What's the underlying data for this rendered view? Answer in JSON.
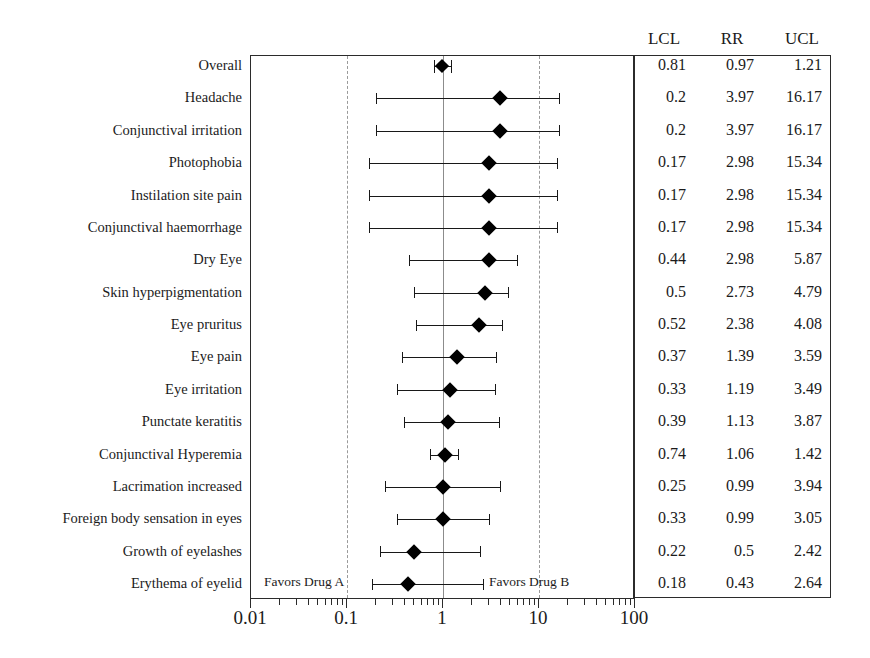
{
  "chart_data": {
    "type": "forest",
    "title": "",
    "xlabel": "",
    "ylabel": "",
    "x_scale": "log10",
    "xlim": [
      0.01,
      100
    ],
    "x_ticks": [
      0.01,
      0.1,
      1,
      10,
      100
    ],
    "x_tick_labels": [
      "0.01",
      "0.1",
      "1",
      "10",
      "100"
    ],
    "reference_line": 1,
    "gridlines": [
      0.1,
      1,
      10
    ],
    "grid": true,
    "legend_position": "none",
    "annotations": [
      {
        "text": "Favors Drug A",
        "x": 0.075,
        "row": 17
      },
      {
        "text": "Favors Drug B",
        "x": 9.5,
        "row": 17
      }
    ],
    "columns": [
      "LCL",
      "RR",
      "UCL"
    ],
    "categories": [
      "Overall",
      "Headache",
      "Conjunctival irritation",
      "Photophobia",
      "Instilation site pain",
      "Conjunctival haemorrhage",
      "Dry Eye",
      "Skin hyperpigmentation",
      "Eye pruritus",
      "Eye pain",
      "Eye irritation",
      "Punctate keratitis",
      "Conjunctival Hyperemia",
      "Lacrimation increased",
      "Foreign body sensation in eyes",
      "Growth of eyelashes",
      "Erythema of eyelid"
    ],
    "rows": [
      {
        "label": "Overall",
        "lcl": 0.81,
        "rr": 0.97,
        "ucl": 1.21,
        "lcl_text": "0.81",
        "rr_text": "0.97",
        "ucl_text": "1.21",
        "overall": true
      },
      {
        "label": "Headache",
        "lcl": 0.2,
        "rr": 3.97,
        "ucl": 16.17,
        "lcl_text": "0.2",
        "rr_text": "3.97",
        "ucl_text": "16.17",
        "overall": false
      },
      {
        "label": "Conjunctival irritation",
        "lcl": 0.2,
        "rr": 3.97,
        "ucl": 16.17,
        "lcl_text": "0.2",
        "rr_text": "3.97",
        "ucl_text": "16.17",
        "overall": false
      },
      {
        "label": "Photophobia",
        "lcl": 0.17,
        "rr": 2.98,
        "ucl": 15.34,
        "lcl_text": "0.17",
        "rr_text": "2.98",
        "ucl_text": "15.34",
        "overall": false
      },
      {
        "label": "Instilation site pain",
        "lcl": 0.17,
        "rr": 2.98,
        "ucl": 15.34,
        "lcl_text": "0.17",
        "rr_text": "2.98",
        "ucl_text": "15.34",
        "overall": false
      },
      {
        "label": "Conjunctival haemorrhage",
        "lcl": 0.17,
        "rr": 2.98,
        "ucl": 15.34,
        "lcl_text": "0.17",
        "rr_text": "2.98",
        "ucl_text": "15.34",
        "overall": false
      },
      {
        "label": "Dry Eye",
        "lcl": 0.44,
        "rr": 2.98,
        "ucl": 5.87,
        "lcl_text": "0.44",
        "rr_text": "2.98",
        "ucl_text": "5.87",
        "overall": false
      },
      {
        "label": "Skin hyperpigmentation",
        "lcl": 0.5,
        "rr": 2.73,
        "ucl": 4.79,
        "lcl_text": "0.5",
        "rr_text": "2.73",
        "ucl_text": "4.79",
        "overall": false
      },
      {
        "label": "Eye pruritus",
        "lcl": 0.52,
        "rr": 2.38,
        "ucl": 4.08,
        "lcl_text": "0.52",
        "rr_text": "2.38",
        "ucl_text": "4.08",
        "overall": false
      },
      {
        "label": "Eye pain",
        "lcl": 0.37,
        "rr": 1.39,
        "ucl": 3.59,
        "lcl_text": "0.37",
        "rr_text": "1.39",
        "ucl_text": "3.59",
        "overall": false
      },
      {
        "label": "Eye irritation",
        "lcl": 0.33,
        "rr": 1.19,
        "ucl": 3.49,
        "lcl_text": "0.33",
        "rr_text": "1.19",
        "ucl_text": "3.49",
        "overall": false
      },
      {
        "label": "Punctate keratitis",
        "lcl": 0.39,
        "rr": 1.13,
        "ucl": 3.87,
        "lcl_text": "0.39",
        "rr_text": "1.13",
        "ucl_text": "3.87",
        "overall": false
      },
      {
        "label": "Conjunctival Hyperemia",
        "lcl": 0.74,
        "rr": 1.06,
        "ucl": 1.42,
        "lcl_text": "0.74",
        "rr_text": "1.06",
        "ucl_text": "1.42",
        "overall": false
      },
      {
        "label": "Lacrimation increased",
        "lcl": 0.25,
        "rr": 0.99,
        "ucl": 3.94,
        "lcl_text": "0.25",
        "rr_text": "0.99",
        "ucl_text": "3.94",
        "overall": false
      },
      {
        "label": "Foreign body sensation in eyes",
        "lcl": 0.33,
        "rr": 0.99,
        "ucl": 3.05,
        "lcl_text": "0.33",
        "rr_text": "0.99",
        "ucl_text": "3.05",
        "overall": false
      },
      {
        "label": "Growth of eyelashes",
        "lcl": 0.22,
        "rr": 0.5,
        "ucl": 2.42,
        "lcl_text": "0.22",
        "rr_text": "0.5",
        "ucl_text": "2.42",
        "overall": false
      },
      {
        "label": "Erythema of eyelid",
        "lcl": 0.18,
        "rr": 0.43,
        "ucl": 2.64,
        "lcl_text": "0.18",
        "rr_text": "0.43",
        "ucl_text": "2.64",
        "overall": false
      }
    ]
  },
  "table": {
    "headers": [
      "LCL",
      "RR",
      "UCL"
    ]
  },
  "axis": {
    "labels": [
      "0.01",
      "0.1",
      "1",
      "10",
      "100"
    ]
  },
  "favors": {
    "left": "Favors Drug A",
    "right": "Favors Drug B"
  }
}
